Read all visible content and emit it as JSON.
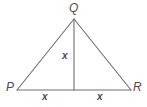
{
  "figure": {
    "name": "isosceles-triangle-with-altitude",
    "background_color": "#ffffff",
    "stroke_color": "#6e6e6e",
    "label_color": "#4a4a4a",
    "vertices": {
      "apex": {
        "label": "Q",
        "x": 74,
        "y": 19
      },
      "bottom_left": {
        "label": "P",
        "x": 17,
        "y": 90
      },
      "bottom_right": {
        "label": "R",
        "x": 131,
        "y": 90
      },
      "foot_of_altitude": {
        "label": "",
        "x": 74,
        "y": 90
      }
    },
    "segments": [
      {
        "name": "side-PQ",
        "from": "P",
        "to": "Q",
        "label": ""
      },
      {
        "name": "side-QR",
        "from": "Q",
        "to": "R",
        "label": ""
      },
      {
        "name": "base-PR",
        "from": "P",
        "to": "R",
        "label": ""
      },
      {
        "name": "altitude-QM",
        "from": "Q",
        "to": "M",
        "label": "x"
      },
      {
        "name": "base-left-PM",
        "from": "P",
        "to": "M",
        "label": "x"
      },
      {
        "name": "base-right-MR",
        "from": "M",
        "to": "R",
        "label": "x"
      }
    ],
    "labels": {
      "apex": "Q",
      "bottom_left": "P",
      "bottom_right": "R",
      "altitude": "x",
      "base_left": "x",
      "base_right": "x"
    }
  }
}
